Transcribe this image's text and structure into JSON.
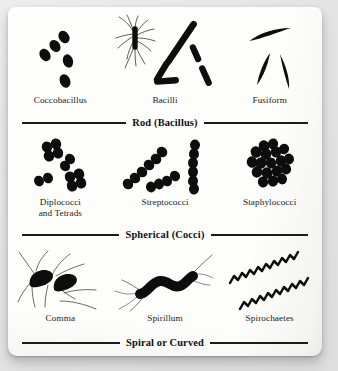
{
  "figure": {
    "background_color": "#e8e8e8",
    "card_color": "#fdfdfc",
    "ink_color": "#101010"
  },
  "bands": [
    {
      "id": "rod",
      "divider_label": "Rod (Bacillus)",
      "specimens": [
        {
          "id": "coccobacillus",
          "caption": "Coccobacillus",
          "art": "coccobacillus-illustration"
        },
        {
          "id": "bacilli",
          "caption": "Bacilli",
          "art": "bacilli-illustration"
        },
        {
          "id": "fusiform",
          "caption": "Fusiform",
          "art": "fusiform-illustration"
        }
      ]
    },
    {
      "id": "cocci",
      "divider_label": "Spherical (Cocci)",
      "specimens": [
        {
          "id": "diplococci-and-tetrads",
          "caption": "Diplococci\nand Tetrads",
          "art": "diplococci-tetrads-illustration"
        },
        {
          "id": "streptococci",
          "caption": "Streptococci",
          "art": "streptococci-illustration"
        },
        {
          "id": "staphylococci",
          "caption": "Staphylococci",
          "art": "staphylococci-illustration"
        }
      ]
    },
    {
      "id": "spiral",
      "divider_label": "Spiral or Curved",
      "specimens": [
        {
          "id": "comma",
          "caption": "Comma",
          "art": "comma-vibrio-illustration"
        },
        {
          "id": "spirillum",
          "caption": "Spirillum",
          "art": "spirillum-illustration"
        },
        {
          "id": "spirochaetes",
          "caption": "Spirochaetes",
          "art": "spirochaetes-illustration"
        }
      ]
    }
  ]
}
